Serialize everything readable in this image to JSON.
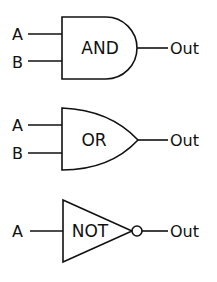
{
  "diagram": {
    "type": "logic-gates",
    "gates": [
      {
        "name": "AND",
        "label": "AND",
        "inputs": [
          "A",
          "B"
        ],
        "output": "Out"
      },
      {
        "name": "OR",
        "label": "OR",
        "inputs": [
          "A",
          "B"
        ],
        "output": "Out"
      },
      {
        "name": "NOT",
        "label": "NOT",
        "inputs": [
          "A"
        ],
        "output": "Out"
      }
    ],
    "colors": {
      "stroke": "#111111",
      "background": "#ffffff"
    }
  }
}
